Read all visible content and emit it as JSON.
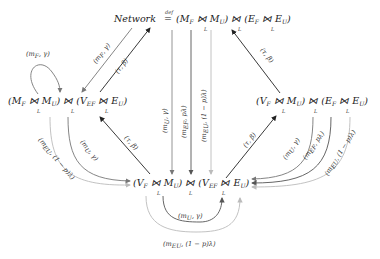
{
  "nodes": {
    "top": {
      "prefix": "Network",
      "defsym": "def",
      "eq": "=",
      "text": "(M_F ⋈_L M_U) ⋈_L (E_F ⋈_L E_U)"
    },
    "left": {
      "text": "(M_F ⋈_L M_U) ⋈_L (V_EF ⋈_L E_U)"
    },
    "right": {
      "text": "(V_F ⋈_L M_U) ⋈_L (E_F ⋈_L E_U)"
    },
    "bottom": {
      "text": "(V_F ⋈_L M_U) ⋈_L (V_EF ⋈_L E_U)"
    }
  },
  "edges": [
    {
      "from": "top",
      "to": "left",
      "label": "(m_F, γ)",
      "color": "#777777"
    },
    {
      "from": "left",
      "to": "top",
      "label": "(τ, β)",
      "color": "#222222"
    },
    {
      "from": "left",
      "to": "left",
      "label": "(m_F, γ)",
      "color": "#777777"
    },
    {
      "from": "right",
      "to": "top",
      "label": "(τ, β)",
      "color": "#222222"
    },
    {
      "from": "top",
      "to": "bottom",
      "label": "(m_U, γ)",
      "color": "#888888"
    },
    {
      "from": "top",
      "to": "bottom",
      "label": "(m_EF, pλ)",
      "color": "#555555"
    },
    {
      "from": "top",
      "to": "bottom",
      "label": "(m_EU, (1 − p)λ)",
      "color": "#bbbbbb"
    },
    {
      "from": "bottom",
      "to": "left",
      "label": "(τ, β)",
      "color": "#222222"
    },
    {
      "from": "left",
      "to": "bottom",
      "label": "(m_U, γ)",
      "color": "#777777"
    },
    {
      "from": "left",
      "to": "bottom",
      "label": "(m_EU, (1 − p)λ)",
      "color": "#bbbbbb"
    },
    {
      "from": "bottom",
      "to": "right",
      "label": "(τ, β)",
      "color": "#222222"
    },
    {
      "from": "right",
      "to": "bottom",
      "label": "(m_U, γ)",
      "color": "#777777"
    },
    {
      "from": "right",
      "to": "bottom",
      "label": "(m_EF, pλ)",
      "color": "#555555"
    },
    {
      "from": "right",
      "to": "bottom",
      "label": "(m_EU, (1 − p)λ)",
      "color": "#bbbbbb"
    },
    {
      "from": "bottom",
      "to": "bottom",
      "label": "(m_U, γ)",
      "color": "#555555"
    },
    {
      "from": "bottom",
      "to": "bottom",
      "label": "(m_EU, (1 − p)λ)",
      "color": "#bbbbbb"
    }
  ],
  "labels": {
    "top_left_mf": "(m",
    "tau_beta": "(τ, β)",
    "mu_gamma": "(m",
    "m": "m",
    "gamma_close": ", γ)",
    "plambda_close": ", pλ)",
    "qlambda_close": ", (1 − p)λ)",
    "F": "F",
    "U": "U",
    "EF": "E",
    "EU": "E",
    "L": "L",
    "bowtie": "⋈"
  }
}
